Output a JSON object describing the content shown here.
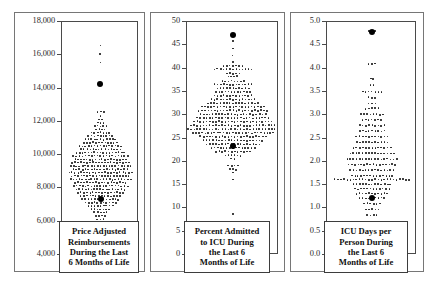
{
  "figure": {
    "background_color": "#ffffff",
    "axis_color": "#4a4a4a",
    "dot_color": "#1a1a1a",
    "highlight_color": "#000000",
    "panel_count": 3
  },
  "panels": [
    {
      "id": "price-adjusted-reimbursements",
      "caption": "Price Adjusted\nReimbursements\nDuring the Last\n6 Months of Life",
      "ticks": [
        "18,000",
        "16,000",
        "14,000",
        "12,000",
        "10,000",
        "8,000",
        "6,000",
        "4,000"
      ],
      "tick_values": [
        18000,
        16000,
        14000,
        12000,
        10000,
        8000,
        6000,
        4000
      ],
      "highlight_labels": [
        "14,300",
        "7,300"
      ]
    },
    {
      "id": "percent-admitted-to-icu",
      "caption": "Percent Admitted\nto ICU During\nthe Last 6\nMonths of Life",
      "ticks": [
        "50",
        "45",
        "40",
        "35",
        "30",
        "25",
        "20",
        "15",
        "10",
        "5",
        "0"
      ],
      "tick_values": [
        50,
        45,
        40,
        35,
        30,
        25,
        20,
        15,
        10,
        5,
        0
      ],
      "highlight_labels": [
        "47.3",
        "23.5"
      ]
    },
    {
      "id": "icu-days-per-person",
      "caption": "ICU Days per\nPerson During\nthe Last 6\nMonths of Life",
      "ticks": [
        "5.0",
        "4.5",
        "4.0",
        "3.5",
        "3.0",
        "2.5",
        "2.0",
        "1.5",
        "1.0",
        "0.5",
        "0.0"
      ],
      "tick_values": [
        5.0,
        4.5,
        4.0,
        3.5,
        3.0,
        2.5,
        2.0,
        1.5,
        1.0,
        0.5,
        0.0
      ],
      "highlight_labels": [
        "4.8",
        "1.2"
      ]
    }
  ],
  "chart_data": [
    {
      "type": "scatter",
      "title": "Price Adjusted Reimbursements During the Last 6 Months of Life",
      "xlabel": "",
      "ylabel": "Price Adjusted Reimbursements",
      "ylim": [
        4000,
        18000
      ],
      "ytick_step": 2000,
      "grid": false,
      "legend": "none",
      "plot_style": "stacked dot plot (one dot per hospital referral region)",
      "rows": [
        {
          "y": 16600,
          "n": 1
        },
        {
          "y": 16100,
          "n": 1
        },
        {
          "y": 15550,
          "n": 1
        },
        {
          "y": 14300,
          "n": 1,
          "highlight": true
        },
        {
          "y": 12600,
          "n": 3
        },
        {
          "y": 12350,
          "n": 1
        },
        {
          "y": 12150,
          "n": 2
        },
        {
          "y": 11950,
          "n": 3
        },
        {
          "y": 11750,
          "n": 5
        },
        {
          "y": 11550,
          "n": 4
        },
        {
          "y": 11350,
          "n": 7
        },
        {
          "y": 11150,
          "n": 9
        },
        {
          "y": 10950,
          "n": 11
        },
        {
          "y": 10750,
          "n": 12
        },
        {
          "y": 10550,
          "n": 15
        },
        {
          "y": 10350,
          "n": 14
        },
        {
          "y": 10150,
          "n": 17
        },
        {
          "y": 9950,
          "n": 19
        },
        {
          "y": 9750,
          "n": 18
        },
        {
          "y": 9550,
          "n": 20
        },
        {
          "y": 9350,
          "n": 21
        },
        {
          "y": 9150,
          "n": 19
        },
        {
          "y": 8950,
          "n": 22
        },
        {
          "y": 8750,
          "n": 20
        },
        {
          "y": 8550,
          "n": 21
        },
        {
          "y": 8350,
          "n": 18
        },
        {
          "y": 8150,
          "n": 19
        },
        {
          "y": 7950,
          "n": 17
        },
        {
          "y": 7750,
          "n": 16
        },
        {
          "y": 7550,
          "n": 14
        },
        {
          "y": 7350,
          "n": 13,
          "highlight_index": 6
        },
        {
          "y": 7150,
          "n": 11
        },
        {
          "y": 6950,
          "n": 9
        },
        {
          "y": 6750,
          "n": 7
        },
        {
          "y": 6550,
          "n": 5
        },
        {
          "y": 6350,
          "n": 4
        },
        {
          "y": 6150,
          "n": 3
        },
        {
          "y": 5950,
          "n": 2
        },
        {
          "y": 5800,
          "n": 1
        }
      ]
    },
    {
      "type": "scatter",
      "title": "Percent Admitted to ICU During the Last 6 Months of Life",
      "xlabel": "",
      "ylabel": "Percent Admitted to ICU",
      "ylim": [
        0,
        50
      ],
      "ytick_step": 5,
      "grid": false,
      "legend": "none",
      "plot_style": "stacked dot plot (one dot per hospital referral region)",
      "rows": [
        {
          "y": 47.3,
          "n": 1,
          "highlight": true
        },
        {
          "y": 46.0,
          "n": 1
        },
        {
          "y": 44.2,
          "n": 1
        },
        {
          "y": 42.8,
          "n": 1
        },
        {
          "y": 41.4,
          "n": 1
        },
        {
          "y": 40.6,
          "n": 7
        },
        {
          "y": 39.9,
          "n": 13
        },
        {
          "y": 39.0,
          "n": 5
        },
        {
          "y": 38.3,
          "n": 4
        },
        {
          "y": 37.3,
          "n": 8
        },
        {
          "y": 36.6,
          "n": 13
        },
        {
          "y": 35.8,
          "n": 11
        },
        {
          "y": 35.0,
          "n": 12
        },
        {
          "y": 34.2,
          "n": 13
        },
        {
          "y": 33.4,
          "n": 15
        },
        {
          "y": 32.6,
          "n": 17
        },
        {
          "y": 31.8,
          "n": 21
        },
        {
          "y": 31.0,
          "n": 23
        },
        {
          "y": 30.2,
          "n": 22
        },
        {
          "y": 29.4,
          "n": 24
        },
        {
          "y": 28.6,
          "n": 26
        },
        {
          "y": 27.8,
          "n": 28
        },
        {
          "y": 27.0,
          "n": 30
        },
        {
          "y": 26.2,
          "n": 27
        },
        {
          "y": 25.4,
          "n": 22
        },
        {
          "y": 24.6,
          "n": 20
        },
        {
          "y": 23.8,
          "n": 18
        },
        {
          "y": 23.5,
          "n": 1,
          "highlight": true
        },
        {
          "y": 23.0,
          "n": 15
        },
        {
          "y": 22.2,
          "n": 12
        },
        {
          "y": 21.4,
          "n": 6
        },
        {
          "y": 20.6,
          "n": 2
        },
        {
          "y": 19.2,
          "n": 4
        },
        {
          "y": 18.4,
          "n": 3
        },
        {
          "y": 17.6,
          "n": 1
        },
        {
          "y": 16.2,
          "n": 1
        },
        {
          "y": 8.8,
          "n": 1
        }
      ]
    },
    {
      "type": "scatter",
      "title": "ICU Days per Person During the Last 6 Months of Life",
      "xlabel": "",
      "ylabel": "ICU Days per Person",
      "ylim": [
        0.0,
        5.0
      ],
      "ytick_step": 0.5,
      "grid": false,
      "legend": "none",
      "plot_style": "stacked dot plot (one dot per hospital referral region)",
      "rows": [
        {
          "y": 4.8,
          "n": 3,
          "highlight_index": 1
        },
        {
          "y": 4.1,
          "n": 3
        },
        {
          "y": 3.78,
          "n": 2
        },
        {
          "y": 3.65,
          "n": 2
        },
        {
          "y": 3.5,
          "n": 7
        },
        {
          "y": 3.38,
          "n": 3
        },
        {
          "y": 3.26,
          "n": 3
        },
        {
          "y": 3.14,
          "n": 5
        },
        {
          "y": 3.02,
          "n": 8
        },
        {
          "y": 2.9,
          "n": 7
        },
        {
          "y": 2.78,
          "n": 9
        },
        {
          "y": 2.66,
          "n": 9
        },
        {
          "y": 2.54,
          "n": 11
        },
        {
          "y": 2.42,
          "n": 11
        },
        {
          "y": 2.3,
          "n": 13
        },
        {
          "y": 2.18,
          "n": 15
        },
        {
          "y": 2.06,
          "n": 17
        },
        {
          "y": 1.94,
          "n": 16
        },
        {
          "y": 1.82,
          "n": 15
        },
        {
          "y": 1.7,
          "n": 14
        },
        {
          "y": 1.62,
          "n": 25
        },
        {
          "y": 1.52,
          "n": 13
        },
        {
          "y": 1.42,
          "n": 12
        },
        {
          "y": 1.32,
          "n": 11
        },
        {
          "y": 1.22,
          "n": 9,
          "highlight_index": 4
        },
        {
          "y": 1.1,
          "n": 6
        },
        {
          "y": 0.98,
          "n": 5
        },
        {
          "y": 0.86,
          "n": 4
        },
        {
          "y": 0.64,
          "n": 1
        },
        {
          "y": 0.52,
          "n": 2
        }
      ]
    }
  ]
}
